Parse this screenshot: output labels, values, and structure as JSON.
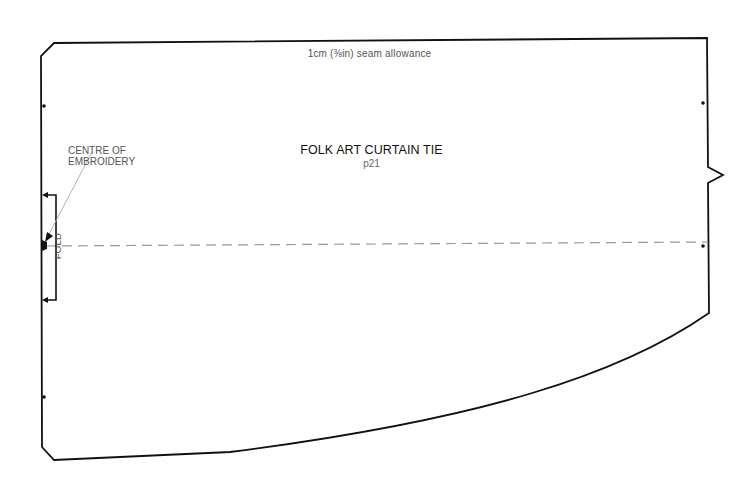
{
  "pattern": {
    "title": "FOLK ART CURTAIN TIE",
    "page_ref": "p21",
    "seam_allowance": "1cm (⅜in) seam allowance",
    "annotations": {
      "centre_line1": "CENTRE OF",
      "centre_line2": "EMBROIDERY",
      "fold": "FOLD"
    },
    "markers": {
      "dots": 5,
      "notch_side": "right"
    },
    "colors": {
      "outline": "#111111",
      "fold_line": "#999999",
      "leader": "#aaaaaa",
      "text": "#555555"
    }
  }
}
